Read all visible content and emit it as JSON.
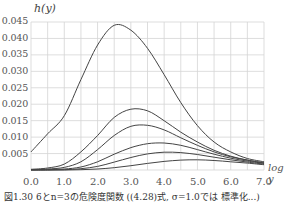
{
  "chart_data": {
    "type": "line",
    "title": "",
    "xlabel": "log y",
    "ylabel": "h(y)",
    "xlim": [
      0.0,
      7.0
    ],
    "ylim": [
      0.0,
      0.045
    ],
    "grid": true,
    "x_ticks": [
      "0.0",
      "1.0",
      "2.0",
      "3.0",
      "4.0",
      "5.0",
      "6.0",
      "7.0"
    ],
    "y_ticks": [
      "0.005",
      "0.010",
      "0.015",
      "0.020",
      "0.025",
      "0.030",
      "0.035",
      "0.040",
      "0.045"
    ],
    "x": [
      0.0,
      0.5,
      1.0,
      1.5,
      2.0,
      2.5,
      3.0,
      3.5,
      4.0,
      4.5,
      5.0,
      5.5,
      6.0,
      6.5,
      7.0
    ],
    "series": [
      {
        "name": "curve-1",
        "values": [
          0.0055,
          0.011,
          0.0165,
          0.0275,
          0.038,
          0.044,
          0.0425,
          0.037,
          0.029,
          0.0205,
          0.0135,
          0.0085,
          0.0055,
          0.0035,
          0.0025
        ]
      },
      {
        "name": "curve-2",
        "values": [
          0.0002,
          0.0006,
          0.0018,
          0.0055,
          0.0105,
          0.016,
          0.0185,
          0.018,
          0.015,
          0.0115,
          0.0085,
          0.006,
          0.0042,
          0.003,
          0.0022
        ]
      },
      {
        "name": "curve-3",
        "values": [
          0.0001,
          0.0003,
          0.0008,
          0.0025,
          0.0062,
          0.0105,
          0.0133,
          0.0136,
          0.0122,
          0.0098,
          0.0075,
          0.0055,
          0.004,
          0.003,
          0.0021
        ]
      },
      {
        "name": "curve-4",
        "values": [
          0.0,
          0.0001,
          0.0003,
          0.0009,
          0.0025,
          0.0048,
          0.0068,
          0.008,
          0.0082,
          0.0075,
          0.0062,
          0.0048,
          0.0036,
          0.0027,
          0.002
        ]
      },
      {
        "name": "curve-5",
        "values": [
          0.0,
          0.0,
          0.0001,
          0.0004,
          0.0011,
          0.0024,
          0.0038,
          0.0049,
          0.0054,
          0.0053,
          0.0047,
          0.0039,
          0.0031,
          0.0024,
          0.0018
        ]
      },
      {
        "name": "curve-6",
        "values": [
          0.0,
          0.0,
          0.0,
          0.0001,
          0.0003,
          0.0007,
          0.0013,
          0.002,
          0.0026,
          0.003,
          0.0031,
          0.0029,
          0.0025,
          0.0021,
          0.0016
        ]
      }
    ],
    "legend": "none"
  },
  "axis": {
    "y_title": "h(y)",
    "x_title": "log y"
  },
  "caption": "図1.30  6とn=3の危険度関数 ((4.28)式, σ=1.0では 標準化...)",
  "colors": {
    "line": "#444444",
    "grid": "#d4d4d4"
  }
}
